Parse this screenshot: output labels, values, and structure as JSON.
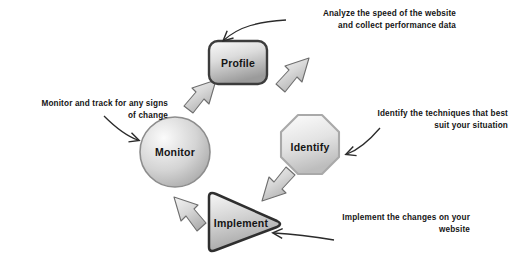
{
  "diagram": {
    "type": "cycle",
    "background": "#ffffff",
    "nodes": [
      {
        "id": "profile",
        "label": "Profile",
        "shape": "rounded-rectangle",
        "cx": 238,
        "cy": 64,
        "order": 1
      },
      {
        "id": "identify",
        "label": "Identify",
        "shape": "octagon",
        "cx": 310,
        "cy": 147,
        "order": 2
      },
      {
        "id": "implement",
        "label": "Implement",
        "shape": "triangle-right",
        "cx": 238,
        "cy": 223,
        "order": 3
      },
      {
        "id": "monitor",
        "label": "Monitor",
        "shape": "circle",
        "cx": 175,
        "cy": 152,
        "order": 4
      }
    ],
    "arrows": [
      {
        "id": "monitor-to-profile",
        "from": "monitor",
        "to": "profile",
        "direction": "up-right"
      },
      {
        "id": "profile-to-identify",
        "from": "profile",
        "to": "identify",
        "direction": "down-right"
      },
      {
        "id": "identify-to-implement",
        "from": "identify",
        "to": "implement",
        "direction": "down-left"
      },
      {
        "id": "implement-to-monitor",
        "from": "implement",
        "to": "monitor",
        "direction": "up-left"
      }
    ],
    "annotations": [
      {
        "id": "profile-note",
        "target": "profile",
        "text": "Analyze the speed of the website\nand collect performance data",
        "align": "right",
        "x": 288,
        "y": 8,
        "width": 168
      },
      {
        "id": "identify-note",
        "target": "identify",
        "text": "Identify the techniques that best\nsuit your situation",
        "align": "right",
        "x": 352,
        "y": 108,
        "width": 156
      },
      {
        "id": "implement-note",
        "target": "implement",
        "text": "Implement the changes on your\nwebsite",
        "align": "right",
        "x": 300,
        "y": 212,
        "width": 170
      },
      {
        "id": "monitor-note",
        "target": "monitor",
        "text": "Monitor and track for any signs\nof change",
        "align": "right",
        "x": 8,
        "y": 98,
        "width": 160
      }
    ],
    "colors": {
      "node_fill_light": "#f2f2f2",
      "node_fill_mid": "#c7c7c7",
      "node_fill_dark": "#9e9e9e",
      "node_stroke_dark": "#3a3a3a",
      "node_stroke_light": "#a9a9a9",
      "arrow_fill": "#cfcfcf",
      "arrow_stroke": "#6e6e6e",
      "leader_stroke": "#2b2b2b",
      "text": "#151515"
    }
  }
}
